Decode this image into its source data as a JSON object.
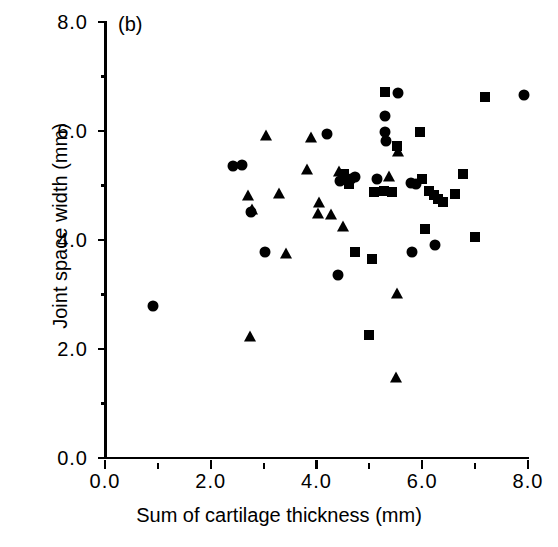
{
  "figure": {
    "panel_label": "(b)",
    "xlabel": "Sum of cartilage thickness (mm)",
    "ylabel": "Joint space width (mm)"
  },
  "axes": {
    "x_tick_labels": [
      "0.0",
      "2.0",
      "4.0",
      "6.0",
      "8.0"
    ],
    "y_tick_labels": [
      "0.0",
      "2.0",
      "4.0",
      "6.0",
      "8.0"
    ],
    "x_major_ticks": [
      0,
      2,
      4,
      6,
      8
    ],
    "y_major_ticks": [
      0,
      2,
      4,
      6,
      8
    ],
    "x_minor_ticks": [
      1,
      3,
      5,
      7
    ],
    "y_minor_ticks": [
      1,
      3,
      5,
      7
    ]
  },
  "chart_data": {
    "type": "scatter",
    "title": "(b)",
    "xlabel": "Sum of cartilage thickness (mm)",
    "ylabel": "Joint space width (mm)",
    "xlim": [
      0,
      8
    ],
    "ylim": [
      0,
      8
    ],
    "grid": false,
    "legend": "none",
    "marker_color": "#000000",
    "series": [
      {
        "name": "circle",
        "marker": "circle",
        "points": [
          [
            0.9,
            2.78
          ],
          [
            2.42,
            5.35
          ],
          [
            2.6,
            5.38
          ],
          [
            2.77,
            4.52
          ],
          [
            3.02,
            3.78
          ],
          [
            4.2,
            5.95
          ],
          [
            4.4,
            3.35
          ],
          [
            4.45,
            5.08
          ],
          [
            4.65,
            5.12
          ],
          [
            4.72,
            5.15
          ],
          [
            5.15,
            5.12
          ],
          [
            5.3,
            6.28
          ],
          [
            5.3,
            5.98
          ],
          [
            5.32,
            5.82
          ],
          [
            5.55,
            6.7
          ],
          [
            5.78,
            5.05
          ],
          [
            5.88,
            5.02
          ],
          [
            5.8,
            3.78
          ],
          [
            6.25,
            3.9
          ],
          [
            7.92,
            6.66
          ]
        ]
      },
      {
        "name": "square",
        "marker": "square",
        "points": [
          [
            4.52,
            5.22
          ],
          [
            4.62,
            5.02
          ],
          [
            5.08,
            4.88
          ],
          [
            5.28,
            4.9
          ],
          [
            5.05,
            3.65
          ],
          [
            4.72,
            3.78
          ],
          [
            5.0,
            2.25
          ],
          [
            5.3,
            6.72
          ],
          [
            5.52,
            5.72
          ],
          [
            5.42,
            4.88
          ],
          [
            5.95,
            5.98
          ],
          [
            6.0,
            5.12
          ],
          [
            6.12,
            4.9
          ],
          [
            6.22,
            4.82
          ],
          [
            6.3,
            4.75
          ],
          [
            6.4,
            4.7
          ],
          [
            6.05,
            4.2
          ],
          [
            6.62,
            4.85
          ],
          [
            6.78,
            5.22
          ],
          [
            7.0,
            4.05
          ],
          [
            7.18,
            6.62
          ]
        ]
      },
      {
        "name": "triangle",
        "marker": "triangle",
        "points": [
          [
            2.7,
            4.85
          ],
          [
            2.78,
            4.58
          ],
          [
            2.75,
            2.25
          ],
          [
            3.05,
            5.95
          ],
          [
            3.3,
            4.88
          ],
          [
            3.42,
            3.78
          ],
          [
            3.82,
            5.32
          ],
          [
            3.9,
            5.9
          ],
          [
            4.05,
            4.72
          ],
          [
            4.02,
            4.52
          ],
          [
            4.28,
            4.5
          ],
          [
            4.42,
            5.28
          ],
          [
            4.5,
            4.28
          ],
          [
            5.38,
            5.2
          ],
          [
            5.55,
            5.65
          ],
          [
            5.52,
            3.05
          ],
          [
            5.5,
            1.5
          ]
        ]
      }
    ]
  }
}
